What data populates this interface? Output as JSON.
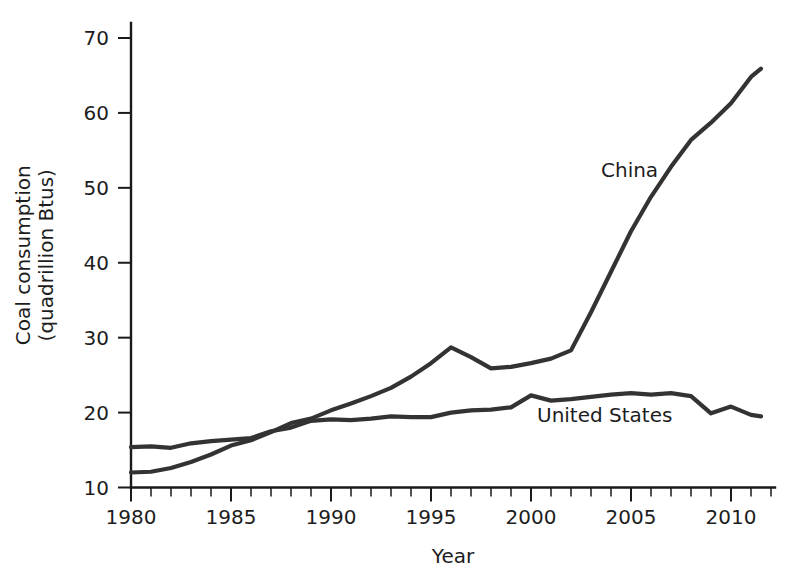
{
  "chart_data": {
    "type": "line",
    "title": "",
    "xlabel": "Year",
    "ylabel": "Coal consumption (quadrillion Btus)",
    "ylabel_line1": "Coal consumption",
    "ylabel_line2": "(quadrillion Btus)",
    "xlim": [
      1980,
      2012.2
    ],
    "ylim": [
      10,
      72
    ],
    "xticks": [
      1980,
      1985,
      1990,
      1995,
      2000,
      2005,
      2010
    ],
    "xtick_labels": [
      "1980",
      "1985",
      "1990",
      "1995",
      "2000",
      "2005",
      "2010"
    ],
    "yticks": [
      10,
      20,
      30,
      40,
      50,
      60,
      70
    ],
    "ytick_labels": [
      "10",
      "20",
      "30",
      "40",
      "50",
      "60",
      "70"
    ],
    "xminor_step": 1,
    "grid": false,
    "legend_position": "inline-annotations",
    "line_color": "#333333",
    "axis_color": "#1a1a1a",
    "x": [
      1980,
      1981,
      1982,
      1983,
      1984,
      1985,
      1986,
      1987,
      1988,
      1989,
      1990,
      1991,
      1992,
      1993,
      1994,
      1995,
      1996,
      1997,
      1998,
      1999,
      2000,
      2001,
      2002,
      2003,
      2004,
      2005,
      2006,
      2007,
      2008,
      2009,
      2010,
      2011,
      2011.5
    ],
    "series": [
      {
        "name": "China",
        "label": "China",
        "label_x": 2003.5,
        "label_y": 51.5,
        "color": "#333333",
        "values": [
          12.0,
          12.1,
          12.6,
          13.4,
          14.4,
          15.6,
          16.3,
          17.4,
          18.6,
          19.2,
          20.3,
          21.2,
          22.2,
          23.3,
          24.8,
          26.6,
          28.7,
          27.4,
          25.9,
          26.1,
          26.6,
          27.2,
          28.3,
          33.4,
          38.8,
          44.2,
          48.8,
          52.8,
          56.4,
          58.7,
          61.3,
          64.8,
          65.9
        ]
      },
      {
        "name": "United States",
        "label": "United States",
        "label_x": 2000.3,
        "label_y": 18.8,
        "color": "#333333",
        "values": [
          15.4,
          15.5,
          15.3,
          15.9,
          16.2,
          16.4,
          16.6,
          17.5,
          18.0,
          18.9,
          19.1,
          19.0,
          19.2,
          19.5,
          19.4,
          19.4,
          20.0,
          20.3,
          20.4,
          20.7,
          22.3,
          21.6,
          21.8,
          22.1,
          22.4,
          22.6,
          22.4,
          22.6,
          22.2,
          19.9,
          20.8,
          19.7,
          19.5
        ]
      }
    ]
  },
  "axes": {
    "x_axis_name": "year-axis",
    "y_axis_name": "coal-consumption-axis"
  }
}
